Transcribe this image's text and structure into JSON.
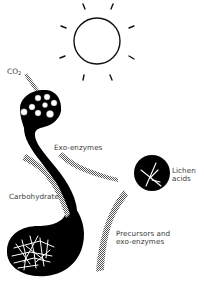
{
  "labels": {
    "co2_main": "CO",
    "co2_sub": "2",
    "exo_enzymes": "Exo-enzymes",
    "carbohydrate": "Carbohydrate",
    "lichen_acids": "Lichen\nacids",
    "precursors": "Precursors and\nexo-enzymes"
  },
  "elements": {
    "sun": "sun-icon",
    "alga_cluster": "algal-cells",
    "fungal_hyphae": "fungal-hyphae",
    "lichen_acid_crystal": "crystal-icon"
  },
  "colors": {
    "ink": "#000000",
    "stipple": "#6e6e6e",
    "text": "#3a3a3a",
    "background": "#ffffff"
  }
}
